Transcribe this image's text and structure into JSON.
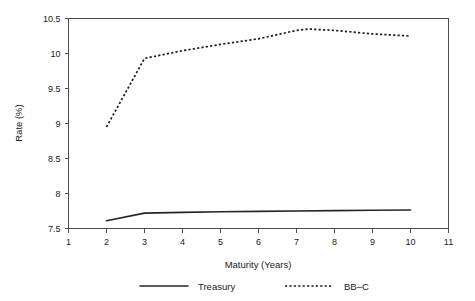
{
  "chart_data": {
    "type": "line",
    "title": "",
    "xlabel": "Maturity (Years)",
    "ylabel": "Rate (%)",
    "xlim": [
      1,
      11
    ],
    "ylim": [
      7.5,
      10.5
    ],
    "grid": false,
    "legend_position": "bottom",
    "xticks": [
      "1",
      "2",
      "3",
      "4",
      "5",
      "6",
      "7",
      "8",
      "9",
      "10",
      "11"
    ],
    "xtick_values": [
      1,
      2,
      3,
      4,
      5,
      6,
      7,
      8,
      9,
      10,
      11
    ],
    "yticks": [
      "7.5",
      "8",
      "8.5",
      "9",
      "9.5",
      "10",
      "10.5"
    ],
    "ytick_values": [
      7.5,
      8,
      8.5,
      9,
      9.5,
      10,
      10.5
    ],
    "series": [
      {
        "name": "Treasury",
        "style": "solid",
        "color": "#262626",
        "x": [
          2,
          3,
          4,
          5,
          6,
          7,
          8,
          9,
          10
        ],
        "values": [
          7.61,
          7.72,
          7.73,
          7.74,
          7.745,
          7.75,
          7.755,
          7.76,
          7.765
        ]
      },
      {
        "name": "BB–C",
        "style": "dotted",
        "color": "#1a1a1a",
        "x": [
          2,
          3,
          4,
          5,
          6,
          7,
          7.3,
          8,
          9,
          10
        ],
        "values": [
          8.95,
          9.93,
          10.04,
          10.13,
          10.21,
          10.33,
          10.35,
          10.33,
          10.28,
          10.25
        ]
      }
    ]
  },
  "legend": {
    "items": [
      {
        "label": "Treasury",
        "style": "solid"
      },
      {
        "label": "BB–C",
        "style": "dotted"
      }
    ]
  }
}
